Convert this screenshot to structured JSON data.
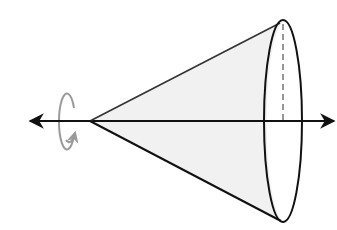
{
  "diagram": {
    "title": "Cone of revolution around a horizontal axis",
    "colors": {
      "stroke": "#111111",
      "rotation_arrow": "#9a9a9a",
      "radius_dashed": "#8c8c8c",
      "cone_fill": "#f1f1f1",
      "background": "#ffffff"
    },
    "axis": {
      "y": 121,
      "x_start": 28,
      "x_end": 336,
      "double_headed": true
    },
    "apex": {
      "x": 90,
      "y": 121
    },
    "base_ellipse": {
      "cx": 283,
      "cy": 121,
      "rx": 19,
      "ry": 101
    },
    "radius_line": {
      "x": 283,
      "y_top": 22,
      "y_bottom": 121,
      "style": "dashed"
    },
    "rotation_arrow": {
      "cx": 68,
      "cy": 121,
      "rx": 8,
      "ry": 28,
      "direction": "counterclockwise-up"
    }
  }
}
